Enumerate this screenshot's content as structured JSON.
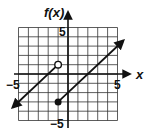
{
  "chart_data": {
    "type": "line",
    "title": "",
    "xlabel": "x",
    "ylabel": "f(x)",
    "xlim": [
      -5,
      5
    ],
    "ylim": [
      -5,
      5
    ],
    "grid": true,
    "tick_labels": {
      "x": [
        "-5",
        "5"
      ],
      "y": [
        "5",
        "-5"
      ]
    },
    "series": [
      {
        "name": "left piece",
        "equation": "f(x) = x + 2, x < -1",
        "points": [
          [
            -5.6,
            -3.6
          ],
          [
            -1,
            1
          ]
        ],
        "start_arrow": true,
        "end_marker": "open-circle",
        "end_point": [
          -1,
          1
        ]
      },
      {
        "name": "right piece",
        "equation": "f(x) = x - 2, x >= -1",
        "points": [
          [
            -1,
            -3
          ],
          [
            5.6,
            3.6
          ]
        ],
        "start_marker": "closed-dot",
        "start_point": [
          -1,
          -3
        ],
        "end_arrow": true
      }
    ]
  },
  "labels": {
    "y_axis": "f(x)",
    "x_axis": "x",
    "x_min": "−5",
    "x_max": "5",
    "y_max": "5",
    "y_min": "−5"
  }
}
